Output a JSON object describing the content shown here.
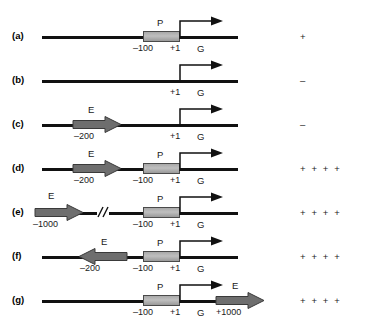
{
  "figure": {
    "result_column_header": "",
    "rows": [
      {
        "panel": "(a)",
        "elements": {
          "promoter_label": "P",
          "left_coord": "–100",
          "start_coord": "+1",
          "gene_label": "G"
        },
        "result": "+"
      },
      {
        "panel": "(b)",
        "elements": {
          "start_coord": "+1",
          "gene_label": "G"
        },
        "result": "–"
      },
      {
        "panel": "(c)",
        "elements": {
          "enhancer_label": "E",
          "enhancer_coord": "–200",
          "start_coord": "+1",
          "gene_label": "G"
        },
        "result": "–"
      },
      {
        "panel": "(d)",
        "elements": {
          "enhancer_label": "E",
          "enhancer_coord": "–200",
          "promoter_label": "P",
          "left_coord": "–100",
          "start_coord": "+1",
          "gene_label": "G"
        },
        "result": "+ + + +"
      },
      {
        "panel": "(e)",
        "elements": {
          "enhancer_label": "E",
          "enhancer_coord": "–1000",
          "promoter_label": "P",
          "left_coord": "–100",
          "start_coord": "+1",
          "gene_label": "G",
          "break_symbol": "//"
        },
        "result": "+ + + +"
      },
      {
        "panel": "(f)",
        "elements": {
          "enhancer_label": "E",
          "enhancer_coord": "–200",
          "promoter_label": "P",
          "left_coord": "–100",
          "start_coord": "+1",
          "gene_label": "G"
        },
        "result": "+ + + +"
      },
      {
        "panel": "(g)",
        "elements": {
          "promoter_label": "P",
          "left_coord": "–100",
          "start_coord": "+1",
          "gene_label": "G",
          "enhancer_label": "E",
          "enhancer_coord": "+1000"
        },
        "result": "+ + + +"
      }
    ],
    "colors": {
      "dna_line": "#111111",
      "promoter_fill": "#b4b4b4",
      "promoter_stroke": "#4a4a4a",
      "enhancer_fill": "#6e6e6e",
      "enhancer_stroke": "#3a3a3a",
      "text": "#1a1a1a",
      "background": "#ffffff"
    }
  }
}
